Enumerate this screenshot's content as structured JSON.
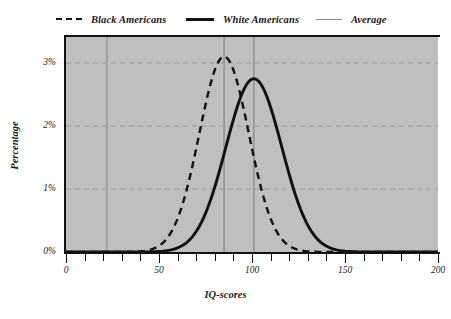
{
  "legend": {
    "items": [
      {
        "label": "Black Americans",
        "key": "dashed-line-key",
        "color": "#111111"
      },
      {
        "label": "White Americans",
        "key": "solid-line-key",
        "color": "#111111"
      },
      {
        "label": "Average",
        "key": "thin-line-key",
        "color": "#8d8d8d"
      }
    ]
  },
  "axes": {
    "y_title": "Percentage",
    "x_title": "IQ-scores",
    "y_ticks": [
      "0%",
      "1%",
      "2%",
      "3%"
    ],
    "x_ticks": [
      "0",
      "50",
      "100",
      "150",
      "200"
    ]
  },
  "chart_data": {
    "type": "line",
    "title": "",
    "subtitle": "",
    "xlabel": "IQ-scores",
    "ylabel": "Percentage",
    "xlim": [
      0,
      200
    ],
    "ylim": [
      0,
      3.3
    ],
    "x_ticks": [
      0,
      50,
      100,
      150,
      200
    ],
    "y_ticks": [
      0,
      1,
      2,
      3
    ],
    "y_tick_labels": [
      "0%",
      "1%",
      "2%",
      "3%"
    ],
    "grid": "dashed-horizontal-and-solid-vertical",
    "legend_position": "top",
    "plot_background": "#bfbfbf",
    "series": [
      {
        "name": "Black Americans",
        "style": "dashed",
        "color": "#111111",
        "distribution": "normal",
        "mean": 85,
        "std_dev": 13.3,
        "peak_value": 3.0,
        "x": [
          40,
          45,
          50,
          55,
          60,
          65,
          70,
          75,
          80,
          85,
          90,
          95,
          100,
          105,
          110,
          115,
          120,
          125,
          130,
          135,
          140,
          145,
          150
        ],
        "y": [
          0.02,
          0.06,
          0.15,
          0.32,
          0.62,
          1.05,
          1.57,
          2.12,
          2.62,
          2.98,
          2.98,
          2.62,
          2.12,
          1.57,
          1.05,
          0.62,
          0.32,
          0.15,
          0.06,
          0.02,
          0.01,
          0.0,
          0.0
        ]
      },
      {
        "name": "White Americans",
        "style": "solid",
        "color": "#111111",
        "distribution": "normal",
        "mean": 101,
        "std_dev": 15.0,
        "peak_value": 2.66,
        "x": [
          50,
          55,
          60,
          65,
          70,
          75,
          80,
          85,
          90,
          95,
          100,
          105,
          110,
          115,
          120,
          125,
          130,
          135,
          140,
          145,
          150,
          155,
          160
        ],
        "y": [
          0.01,
          0.02,
          0.05,
          0.11,
          0.22,
          0.4,
          0.68,
          1.05,
          1.48,
          1.92,
          2.28,
          2.52,
          2.63,
          2.52,
          2.28,
          1.92,
          1.48,
          1.05,
          0.68,
          0.4,
          0.22,
          0.11,
          0.05
        ]
      }
    ],
    "reference_lines": [
      {
        "name": "Average",
        "orientation": "vertical",
        "x": 22,
        "color": "#8d8d8d"
      },
      {
        "name": "Average",
        "orientation": "vertical",
        "x": 85,
        "color": "#8d8d8d"
      },
      {
        "name": "Average",
        "orientation": "vertical",
        "x": 101,
        "color": "#8d8d8d"
      }
    ]
  }
}
